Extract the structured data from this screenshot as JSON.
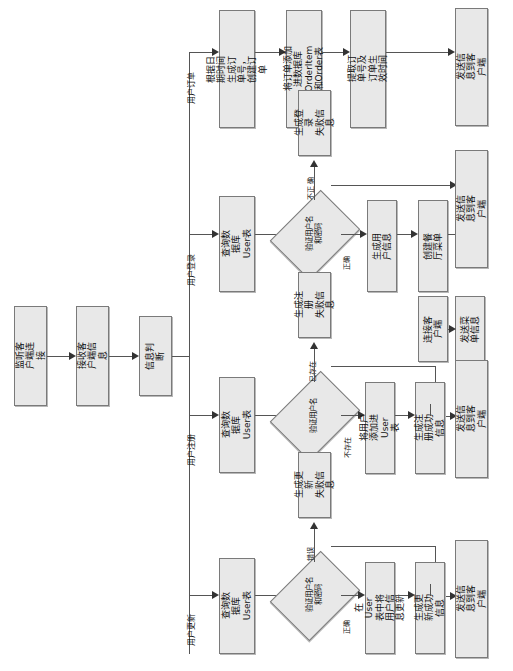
{
  "diagram": {
    "orientation": "rotated-90",
    "colors": {
      "node_fill": "#e8e8e8",
      "node_border": "#7a7a7a",
      "line": "#555555",
      "arrow": "#333333",
      "background": "#ffffff"
    },
    "trunk": {
      "n1": "监听客户端连接",
      "n2": "接收客户端信息",
      "n3": "信息判断"
    },
    "branch_labels": {
      "order": "用户订单",
      "login": "用户登录",
      "register": "用户注册",
      "update": "用户更新"
    },
    "order_branch": {
      "s1": "根据日期时间生成订\n单号，创建订单",
      "s2": "将订单添加进数据库\nOrderItem和Order表",
      "s3": "提取订单号及订单生\n效时间",
      "s4": "发送信息到客户端"
    },
    "login_branch": {
      "query": "查询数据库User表",
      "decision": "验证用户名\n和密码",
      "label_fail": "不正\n确",
      "label_ok": "正确",
      "fail_msg": "生成登录\n失败信息",
      "s1": "生成用户信息",
      "s2": "创建餐厅菜单",
      "s3": "连接客户端",
      "s4": "发送菜单信息",
      "send": "发送信息到客户端"
    },
    "register_branch": {
      "query": "查询数据库User表",
      "decision": "验证用户名",
      "label_exists": "已存在",
      "label_not_exists": "不存在",
      "fail_msg": "生成注册\n失败信息",
      "s1": "将用户添加进\nUser表",
      "s2": "生成注册成功\n信息",
      "send": "发送信息到客户端"
    },
    "update_branch": {
      "query": "查询数据库User表",
      "decision": "验证用户名\n和密码",
      "label_fail": "错误",
      "label_ok": "正确",
      "fail_msg": "生成更新\n失败信息",
      "s1": "在User表中将\n用户信息更新",
      "s2": "生成更新成功\n信息",
      "send": "发送信息到客户端"
    }
  }
}
